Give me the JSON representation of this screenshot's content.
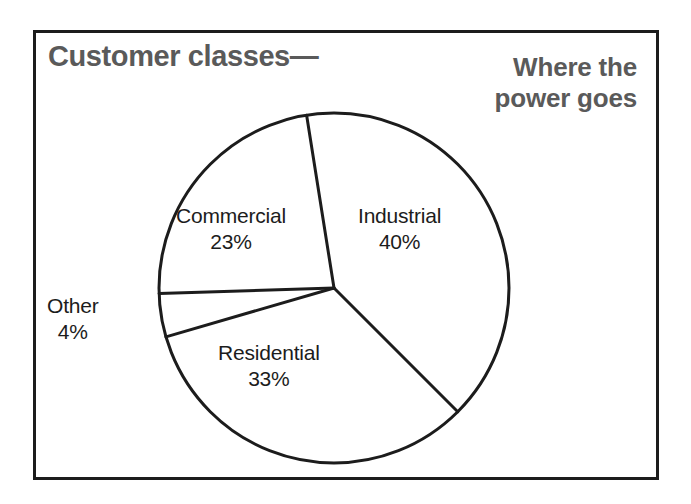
{
  "figure": {
    "title_left": "Customer classes—",
    "title_right_line1": "Where the",
    "title_right_line2": "power goes",
    "border_color": "#1c1c1c",
    "title_color": "#5a5a5a",
    "label_color": "#1c1c1c"
  },
  "chart_data": {
    "type": "pie",
    "title": "Customer classes— Where the power goes",
    "categories": [
      "Industrial",
      "Residential",
      "Other",
      "Commercial"
    ],
    "values": [
      40,
      33,
      4,
      23
    ],
    "unit": "%",
    "labels": [
      {
        "name": "Industrial",
        "value": "40%"
      },
      {
        "name": "Residential",
        "value": "33%"
      },
      {
        "name": "Other",
        "value": "4%"
      },
      {
        "name": "Commercial",
        "value": "23%"
      }
    ],
    "legend": "none",
    "grid": false,
    "slice_fill": "#ffffff",
    "slice_stroke": "#1c1c1c",
    "start_angle_deg": -9,
    "direction": "clockwise"
  },
  "slices": {
    "industrial": {
      "name": "Industrial",
      "value": "40%"
    },
    "residential": {
      "name": "Residential",
      "value": "33%"
    },
    "other": {
      "name": "Other",
      "value": "4%"
    },
    "commercial": {
      "name": "Commercial",
      "value": "23%"
    }
  }
}
